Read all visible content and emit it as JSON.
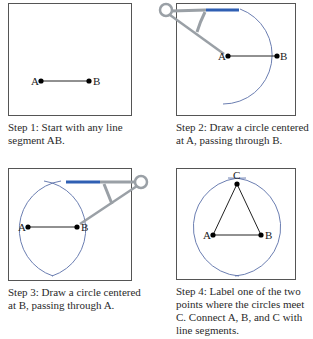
{
  "steps": [
    {
      "caption": "Step 1: Start with any line segment AB.",
      "labels": {
        "a": "A",
        "b": "B"
      }
    },
    {
      "caption": "Step 2: Draw a circle centered at A, passing through B.",
      "labels": {
        "a": "A",
        "b": "B"
      }
    },
    {
      "caption": "Step 3: Draw a circle centered at B, passing through A.",
      "labels": {
        "a": "A",
        "b": "B"
      }
    },
    {
      "caption": "Step 4: Label one of the two points where the circles meet C. Connect A, B, and C with line segments.",
      "labels": {
        "a": "A",
        "b": "B",
        "c": "C"
      }
    }
  ],
  "colors": {
    "frame": "#555555",
    "arc": "#5a6fa8",
    "compass": "#9aa0a6",
    "pencil": "#2f5fb3"
  }
}
